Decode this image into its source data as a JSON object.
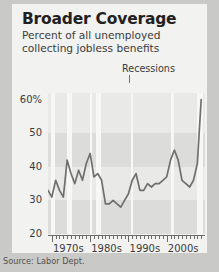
{
  "card": {
    "title": "Broader Coverage",
    "subtitle": "Percent of all unemployed collecting jobless benefits",
    "annotation": "Recessions",
    "source": "Source: Labor Dept."
  },
  "colors": {
    "page_background": "#c9c9c7",
    "card_background": "#f2f2f0",
    "plot_background": "#e9e9e7",
    "gridband": "#dcdcda",
    "recession_band": "#f7f7f6",
    "line": "#6f6f6f",
    "axis": "#6b6b6b",
    "title_text": "#231f20",
    "body_text": "#3b3b3b"
  },
  "chart_data": {
    "type": "line",
    "title": "Broader Coverage",
    "subtitle": "Percent of all unemployed collecting jobless benefits",
    "xlabel": "",
    "ylabel": "",
    "ylim": [
      20,
      62
    ],
    "xlim": [
      1969,
      2010
    ],
    "grid": true,
    "legend": null,
    "annotations": [
      "Recessions"
    ],
    "yticks": [
      20,
      30,
      40,
      50,
      60
    ],
    "ytick_labels": [
      "20",
      "30",
      "40",
      "50",
      "60%"
    ],
    "xticks": [
      1970,
      1980,
      1990,
      2000
    ],
    "xtick_labels": [
      "1970s",
      "1980s",
      "1990s",
      "2000s"
    ],
    "minor_xtick_interval": 1,
    "series": [
      {
        "name": "Percent of unemployed collecting benefits",
        "x": [
          1969,
          1970,
          1971,
          1972,
          1973,
          1974,
          1975,
          1976,
          1977,
          1978,
          1979,
          1980,
          1981,
          1982,
          1983,
          1984,
          1985,
          1986,
          1987,
          1988,
          1989,
          1990,
          1991,
          1992,
          1993,
          1994,
          1995,
          1996,
          1997,
          1998,
          1999,
          2000,
          2001,
          2002,
          2003,
          2004,
          2005,
          2006,
          2007,
          2008,
          2009
        ],
        "values": [
          33,
          31,
          36,
          33,
          31,
          42,
          38,
          35,
          39,
          36,
          41,
          44,
          37,
          38,
          36,
          29,
          29,
          30,
          29,
          28,
          30,
          32,
          36,
          38,
          33,
          33,
          35,
          34,
          35,
          35,
          36,
          37,
          42,
          45,
          42,
          36,
          35,
          34,
          36,
          41,
          60
        ]
      }
    ],
    "recession_bands": [
      {
        "start": 1969.9,
        "end": 1970.9
      },
      {
        "start": 1973.9,
        "end": 1975.2
      },
      {
        "start": 1980.0,
        "end": 1980.6
      },
      {
        "start": 1981.6,
        "end": 1982.9
      },
      {
        "start": 1990.6,
        "end": 1991.2
      },
      {
        "start": 2001.2,
        "end": 2001.9
      },
      {
        "start": 2007.9,
        "end": 2009.5
      }
    ]
  }
}
